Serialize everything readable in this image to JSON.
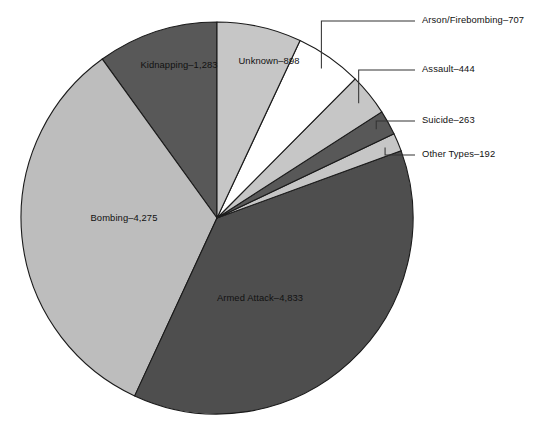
{
  "chart_data": {
    "type": "pie",
    "title": "",
    "subtitle": "",
    "xlabel": "",
    "ylabel": "",
    "legend_position": "none",
    "grid": false,
    "total": 12895,
    "categories": [
      "Armed Attack",
      "Bombing",
      "Kidnapping",
      "Unknown",
      "Arson/Firebombing",
      "Assault",
      "Suicide",
      "Other Types"
    ],
    "values": [
      4833,
      4275,
      1283,
      898,
      707,
      444,
      263,
      192
    ],
    "slices": [
      {
        "name": "Armed Attack",
        "value": 4833,
        "label": "Armed Attack–4,833",
        "color": "#4e4e4e",
        "label_placement": "inside",
        "label_x": 260,
        "label_y": 301
      },
      {
        "name": "Bombing",
        "value": 4275,
        "label": "Bombing–4,275",
        "color": "#bdbdbd",
        "label_placement": "inside",
        "label_x": 124,
        "label_y": 221
      },
      {
        "name": "Kidnapping",
        "value": 1283,
        "label": "Kidnapping–1,283",
        "color": "#585858",
        "label_placement": "inside",
        "label_x": 179,
        "label_y": 68
      },
      {
        "name": "Unknown",
        "value": 898,
        "label": "Unknown–898",
        "color": "#c6c6c6",
        "label_placement": "inside",
        "label_x": 269,
        "label_y": 64
      },
      {
        "name": "Arson/Firebombing",
        "value": 707,
        "label": "Arson/Firebombing–707",
        "color": "#ffffff",
        "label_placement": "outside",
        "label_x": 422,
        "label_y": 21
      },
      {
        "name": "Assault",
        "value": 444,
        "label": "Assault–444",
        "color": "#c6c6c6",
        "label_placement": "outside",
        "label_x": 422,
        "label_y": 70
      },
      {
        "name": "Suicide",
        "value": 263,
        "label": "Suicide–263",
        "color": "#585858",
        "label_placement": "outside",
        "label_x": 422,
        "label_y": 121
      },
      {
        "name": "Other Types",
        "value": 192,
        "label": "Other Types–192",
        "color": "#c6c6c6",
        "label_placement": "outside",
        "label_x": 422,
        "label_y": 155
      }
    ],
    "geometry": {
      "center_x": 217,
      "center_y": 218,
      "radius": 196,
      "start_angle_deg": -90,
      "direction": "counterclockwise"
    },
    "style": {
      "background": "#ffffff",
      "slice_border": "#1a1a1a",
      "leader_line": "#333333",
      "text": "#111111"
    }
  }
}
